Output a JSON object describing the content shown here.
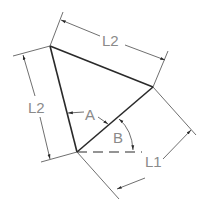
{
  "diagram": {
    "type": "geometric dimension drawing",
    "shape": "triangle",
    "vertices": {
      "top_left": [
        50,
        46
      ],
      "right": [
        153,
        87
      ],
      "bottom": [
        77,
        152
      ]
    },
    "labels": {
      "top_side": "L2",
      "left_side": "L2",
      "bottom_right_side": "L1",
      "angle_a": "A",
      "angle_b": "B"
    },
    "colors": {
      "background": "#ffffff",
      "edge": "#2a2a2a",
      "dimension": "#4a4a4a",
      "label": "#8a8a8a"
    }
  }
}
